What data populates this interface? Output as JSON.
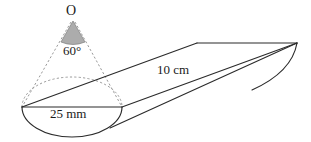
{
  "figure": {
    "labels": {
      "apex": "O",
      "apex_angle": "60°",
      "base_diameter": "25 mm",
      "slant_length": "10 cm"
    },
    "icon_names": {
      "cone_shade": "shaded-cone-icon",
      "dashed_guide": "dashed-guide-line-icon"
    },
    "colors": {
      "stroke": "#2b2b2b",
      "dashed_stroke": "#8f8f8f",
      "cone_fill": "#a8a8a8",
      "background": "#ffffff"
    },
    "geometry": {
      "apex_point": [
        73,
        20
      ],
      "ellipse_center": [
        72,
        107
      ],
      "ellipse_rx": 50,
      "ellipse_ry": 30,
      "left_vertex": [
        22,
        107
      ],
      "right_vertex": [
        122,
        107
      ],
      "tip_point": [
        297,
        43
      ],
      "top_ridge_start": [
        197,
        43
      ]
    }
  }
}
